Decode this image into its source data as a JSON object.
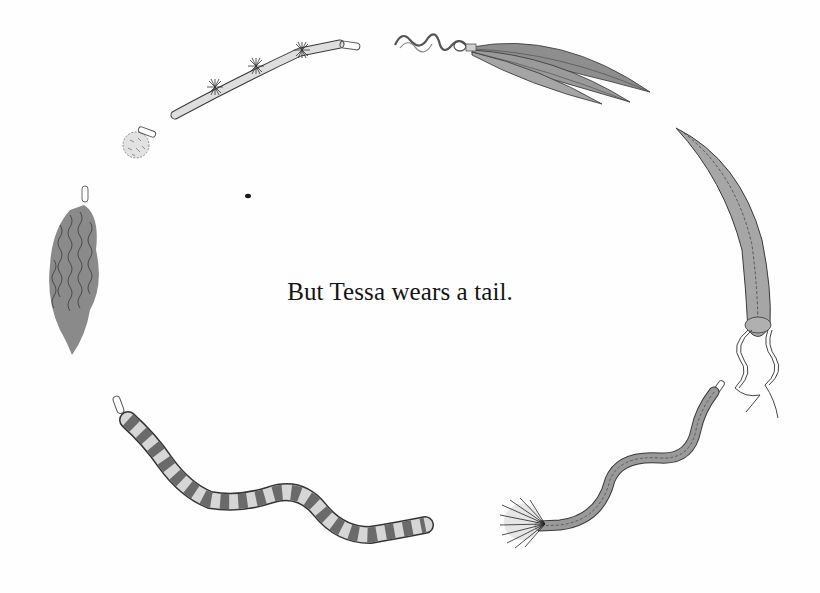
{
  "page": {
    "caption": "But Tessa wears a tail.",
    "background": "#fefefe",
    "text_color": "#141414"
  },
  "illustrations": [
    {
      "id": "stick-tail",
      "description": "tan stick tail with tufts and safety pin"
    },
    {
      "id": "pompom-tail",
      "description": "small round fuzzy pom-pom tail with pin"
    },
    {
      "id": "feather-tail",
      "description": "three grey feathers on curly string"
    },
    {
      "id": "fur-tail",
      "description": "long shaggy grey fur tail with pin"
    },
    {
      "id": "stuffed-tail",
      "description": "curved stitched stuffed tail with ribbon ties"
    },
    {
      "id": "striped-tail",
      "description": "long ringed striped furry tail with pin"
    },
    {
      "id": "tufted-tail",
      "description": "wavy stitched tail with bristly tuft end"
    }
  ],
  "colors": {
    "ink": "#3a3a3a",
    "grey_fill": "#9a9a9a",
    "light_fill": "#d8d8d8",
    "mid_fill": "#b5b5b5"
  }
}
